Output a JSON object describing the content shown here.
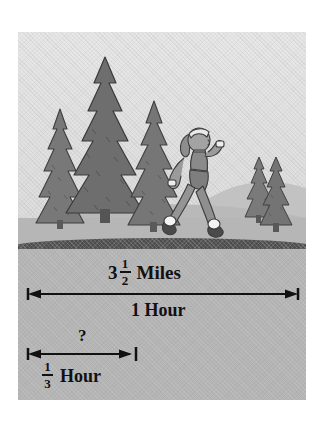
{
  "figure": {
    "type": "illustrated-word-problem",
    "palette": {
      "page_background": "#ffffff",
      "panel_background": "#b4b4b4",
      "sky": "#e4e4e4",
      "hill": "#bdbdbd",
      "tree": "#707070",
      "tree_outline": "#3c3c3c",
      "road": "#4d4d4d",
      "ink": "#111111",
      "skin": "#9a9a9a",
      "outfit": "#8a8a8a",
      "shoe": "#f2f2f2"
    }
  },
  "scene": {
    "trees_left": [
      {
        "name": "pine-small-left",
        "height_label": "short"
      },
      {
        "name": "pine-tall-center",
        "height_label": "tall"
      },
      {
        "name": "pine-medium-right",
        "height_label": "medium"
      }
    ],
    "trees_right": [
      {
        "name": "pine-right-back",
        "height_label": "small"
      },
      {
        "name": "pine-right-front",
        "height_label": "small"
      }
    ],
    "walker": {
      "name": "walking-woman",
      "description": "woman power-walking to the right",
      "accessories": [
        "headband",
        "wristbands",
        "sports top",
        "leggings",
        "sneakers"
      ]
    },
    "road": {
      "name": "road-band"
    }
  },
  "measurements": {
    "distance": {
      "whole": "3",
      "fraction_numerator": "1",
      "fraction_denominator": "2",
      "unit": "Miles",
      "full_text": "3 1/2 Miles"
    },
    "total_time": {
      "text": "1 Hour",
      "value": "1",
      "unit": "Hour"
    },
    "unknown": {
      "text": "?"
    },
    "partial_time": {
      "fraction_numerator": "1",
      "fraction_denominator": "3",
      "unit": "Hour",
      "full_text": "1/3 Hour"
    }
  },
  "arrows": {
    "full_span": {
      "name": "arrow-full-span",
      "label_above": "3 1/2 Miles",
      "label_below": "1 Hour",
      "style": "double-headed-with-end-ticks"
    },
    "partial_span": {
      "name": "arrow-partial-span",
      "label_above": "?",
      "label_below": "1/3 Hour",
      "style": "left-tick-right-arrow-with-end-tick"
    }
  }
}
